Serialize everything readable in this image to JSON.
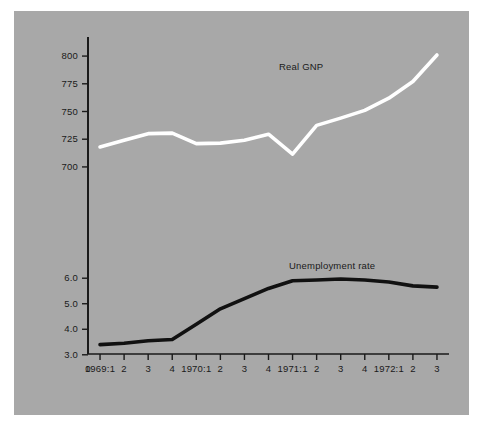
{
  "figure": {
    "background_color": "#a8a8a8",
    "page_color": "#ffffff",
    "axis_color": "#1a1a1a"
  },
  "chart_data": {
    "type": "line",
    "title": "",
    "xlabel": "",
    "ylabel": "",
    "grid": false,
    "legend_position": "inline-annotation",
    "x_origin_label": "0",
    "categories": [
      "1969:1",
      "2",
      "3",
      "4",
      "1970:1",
      "2",
      "3",
      "4",
      "1971:1",
      "2",
      "3",
      "4",
      "1972:1",
      "2",
      "3"
    ],
    "axes": [
      {
        "name": "real-gnp-axis",
        "side": "left-upper",
        "ticks": [
          800,
          775,
          750,
          725,
          700
        ],
        "tick_labels": [
          "800",
          "775",
          "750",
          "725",
          "700"
        ],
        "ylim": [
          690,
          810
        ]
      },
      {
        "name": "unemployment-axis",
        "side": "left-lower",
        "ticks": [
          6.0,
          5.0,
          4.0,
          3.0
        ],
        "tick_labels": [
          "6.0",
          "5.0",
          "4.0",
          "3.0"
        ],
        "ylim": [
          2.6,
          6.4
        ]
      }
    ],
    "series": [
      {
        "name": "Real GNP",
        "label": "Real GNP",
        "color": "#ffffff",
        "axis": "real-gnp-axis",
        "values": [
          718,
          724,
          730,
          730.5,
          721,
          721.5,
          724,
          729.5,
          711.5,
          737.5,
          744,
          751,
          762,
          777,
          801
        ]
      },
      {
        "name": "Unemployment rate",
        "label": "Unemployment rate",
        "color": "#111111",
        "axis": "unemployment-axis",
        "values": [
          3.4,
          3.45,
          3.55,
          3.6,
          4.2,
          4.8,
          5.2,
          5.6,
          5.9,
          5.93,
          5.97,
          5.93,
          5.85,
          5.7,
          5.65
        ]
      }
    ],
    "annotations": [
      {
        "text": "Real GNP",
        "x_category": "3",
        "x_index": 10,
        "axis": "real-gnp-axis",
        "value_near": 780
      },
      {
        "text": "Unemployment rate",
        "x_category": "4",
        "x_index": 11,
        "axis": "unemployment-axis",
        "value_near": 6.25
      }
    ]
  }
}
